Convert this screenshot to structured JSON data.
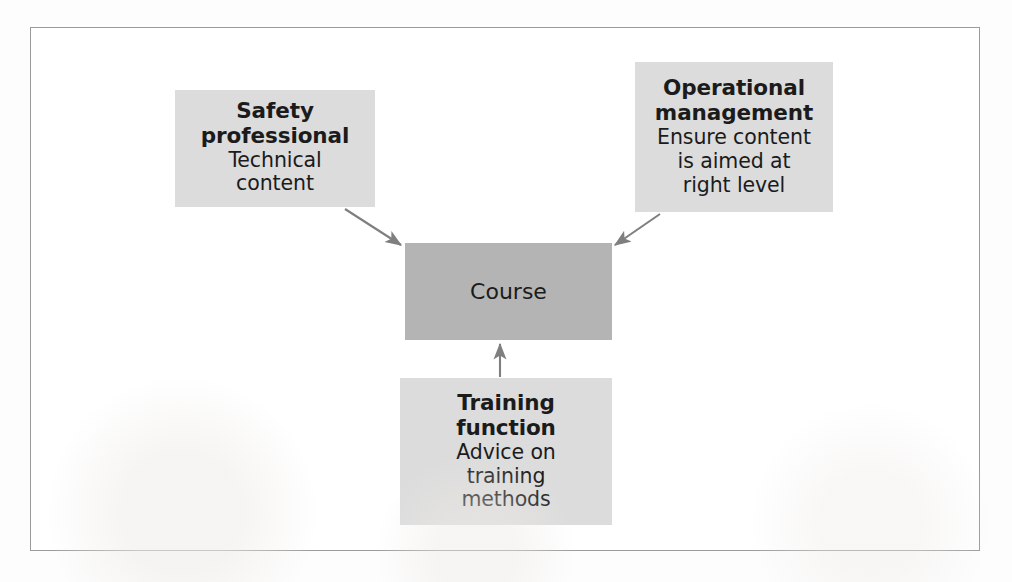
{
  "figure": {
    "kind": "relationship-diagram",
    "frame_border_color": "#9b9b9b",
    "page_background": "#fdfdfd",
    "light_box_color": "#dcdcdc",
    "dark_box_color": "#b4b4b4",
    "arrow_color": "#7f7f7f",
    "text_color": "#1b1b1b"
  },
  "nodes": {
    "safety": {
      "title": "Safety\nprofessional",
      "title_line1": "Safety",
      "title_line2": "professional",
      "sub_line1": "Technical",
      "sub_line2": "content"
    },
    "operational": {
      "title_line1": "Operational",
      "title_line2": "management",
      "sub_line1": "Ensure content",
      "sub_line2": "is aimed at",
      "sub_line3": "right level"
    },
    "course": {
      "label": "Course"
    },
    "training": {
      "title_line1": "Training",
      "title_line2": "function",
      "sub_line1": "Advice on",
      "sub_line2": "training",
      "sub_line3": "methods"
    }
  },
  "arrows": [
    {
      "name": "safety-to-course",
      "from": "safety",
      "to": "course",
      "direction": "down-right"
    },
    {
      "name": "operational-to-course",
      "from": "operational",
      "to": "course",
      "direction": "down-left"
    },
    {
      "name": "training-to-course",
      "from": "training",
      "to": "course",
      "direction": "up"
    }
  ]
}
